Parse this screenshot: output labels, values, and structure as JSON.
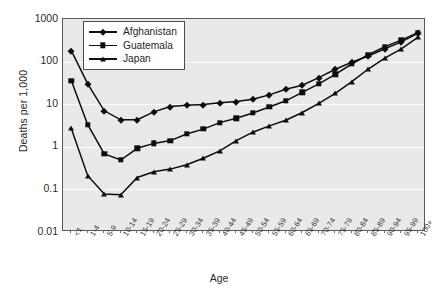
{
  "chart_data": {
    "type": "line",
    "title": "",
    "xlabel": "Age",
    "ylabel": "Deaths per 1,000",
    "yscale": "log",
    "ylim": [
      0.01,
      1000
    ],
    "ytick_labels": [
      "1000",
      "100",
      "10",
      "1",
      "0.1",
      "0.01"
    ],
    "ytick_values": [
      1000,
      100,
      10,
      1,
      0.1,
      0.01
    ],
    "grid": "horizontal",
    "legend_position": "top-left",
    "categories": [
      "<1",
      "1-4",
      "5-9",
      "10-14",
      "15-19",
      "20-24",
      "25-29",
      "30-34",
      "35-39",
      "40-44",
      "45-49",
      "50-54",
      "55-59",
      "60-64",
      "65-69",
      "70-74",
      "75-79",
      "80-84",
      "85-89",
      "90-94",
      "95-99",
      "100+"
    ],
    "series": [
      {
        "name": "Afghanistan",
        "marker": "diamond",
        "values": [
          180,
          30,
          7.0,
          4.3,
          4.3,
          6.6,
          8.8,
          9.4,
          9.8,
          10.8,
          11.6,
          13.0,
          16.5,
          22.5,
          28.0,
          42.0,
          66.0,
          97.0,
          135.0,
          200.0,
          290.0,
          460.0
        ]
      },
      {
        "name": "Guatemala",
        "marker": "square",
        "values": [
          36,
          3.3,
          0.68,
          0.49,
          0.92,
          1.2,
          1.4,
          2.0,
          2.6,
          3.7,
          4.7,
          6.2,
          8.6,
          12.0,
          19.0,
          30.0,
          50.0,
          88.0,
          145.0,
          225.0,
          320.0,
          480.0
        ]
      },
      {
        "name": "Japan",
        "marker": "triangle",
        "values": [
          2.7,
          0.21,
          0.078,
          0.075,
          0.19,
          0.26,
          0.3,
          0.38,
          0.54,
          0.8,
          1.4,
          2.2,
          3.1,
          4.2,
          6.4,
          10.5,
          18.0,
          34.0,
          67.0,
          120.0,
          200.0,
          370.0
        ]
      }
    ]
  },
  "axes": {
    "y_title": "Deaths per 1,000",
    "x_title": "Age"
  },
  "legend": {
    "entries": [
      {
        "label": "Afghanistan",
        "marker": "diamond"
      },
      {
        "label": "Guatemala",
        "marker": "square"
      },
      {
        "label": "Japan",
        "marker": "triangle"
      }
    ]
  },
  "colors": {
    "series_color": "#0d0d0d",
    "plot_background": "#e9e9e9",
    "gridline": "#fdfdfd",
    "frame": "#59595c",
    "page_background": "#ffffff"
  },
  "caption": {
    "partial_text": ""
  }
}
